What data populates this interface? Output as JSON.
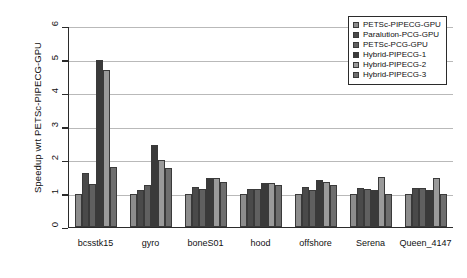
{
  "chart_data": {
    "type": "bar",
    "title": "",
    "xlabel": "",
    "ylabel": "Speedup wrt PETSc-PIPECG-GPU",
    "ylim": [
      0,
      6
    ],
    "yticks": [
      "0",
      "1",
      "2",
      "3",
      "4",
      "5",
      "6"
    ],
    "grid": true,
    "legend_position": "upper right",
    "categories": [
      "bcsstk15",
      "gyro",
      "boneS01",
      "hood",
      "offshore",
      "Serena",
      "Queen_4147"
    ],
    "series": [
      {
        "name": "PETSc-PIPECG-GPU",
        "color": "#8c8c8c",
        "values": [
          1.0,
          1.0,
          1.0,
          1.0,
          1.0,
          1.0,
          1.0
        ]
      },
      {
        "name": "Paralution-PCG-GPU",
        "color": "#4a4a4a",
        "values": [
          1.6,
          1.1,
          1.18,
          1.12,
          1.2,
          1.15,
          1.15
        ]
      },
      {
        "name": "PETSc-PCG-GPU",
        "color": "#606060",
        "values": [
          1.28,
          1.25,
          1.12,
          1.12,
          1.1,
          1.12,
          1.15
        ]
      },
      {
        "name": "Hybrid-PIPECG-1",
        "color": "#3a3a3a",
        "values": [
          5.0,
          2.45,
          1.45,
          1.3,
          1.4,
          1.1,
          1.1
        ]
      },
      {
        "name": "Hybrid-PIPECG-2",
        "color": "#9a9a9a",
        "values": [
          4.7,
          2.0,
          1.45,
          1.3,
          1.35,
          1.5,
          1.45
        ]
      },
      {
        "name": "Hybrid-PIPECG-3",
        "color": "#6e6e6e",
        "values": [
          1.8,
          1.75,
          1.35,
          1.25,
          1.25,
          1.0,
          1.0
        ]
      }
    ]
  }
}
